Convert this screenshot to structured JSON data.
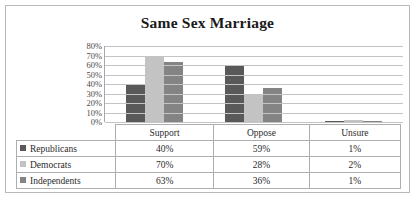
{
  "chart_data": {
    "type": "bar",
    "title": "Same Sex Marriage",
    "xlabel": "",
    "ylabel": "",
    "ylim": [
      0,
      80
    ],
    "grid": true,
    "legend_position": "table-left",
    "categories": [
      "Support",
      "Oppose",
      "Unsure"
    ],
    "ytick_labels": [
      "80%",
      "70%",
      "60%",
      "50%",
      "40%",
      "30%",
      "20%",
      "10%",
      "0%"
    ],
    "ytick_values": [
      80,
      70,
      60,
      50,
      40,
      30,
      20,
      10,
      0
    ],
    "series": [
      {
        "name": "Republicans",
        "color": "#595959",
        "values": [
          40,
          59,
          1
        ],
        "labels": [
          "40%",
          "59%",
          "1%"
        ]
      },
      {
        "name": "Democrats",
        "color": "#c3c3c3",
        "values": [
          70,
          28,
          2
        ],
        "labels": [
          "70%",
          "28%",
          "2%"
        ]
      },
      {
        "name": "Independents",
        "color": "#848484",
        "values": [
          63,
          36,
          1
        ],
        "labels": [
          "63%",
          "36%",
          "1%"
        ]
      }
    ]
  }
}
